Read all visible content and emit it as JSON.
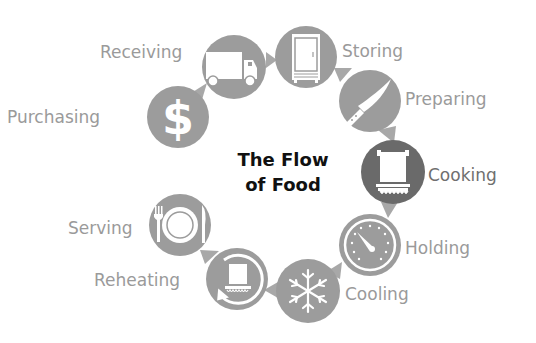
{
  "title": {
    "line1": "The Flow",
    "line2": "of Food"
  },
  "colors": {
    "circle": "#9c9c9c",
    "circle_active": "#6a6a6a",
    "arrow": "#a8a8a8",
    "label": "#9a9a9a",
    "label_active": "#6f6f6f",
    "title": "#111111"
  },
  "steps": [
    {
      "order": 1,
      "label": "Purchasing",
      "icon": "dollar-icon"
    },
    {
      "order": 2,
      "label": "Receiving",
      "icon": "truck-icon"
    },
    {
      "order": 3,
      "label": "Storing",
      "icon": "refrigerator-icon"
    },
    {
      "order": 4,
      "label": "Preparing",
      "icon": "knife-icon"
    },
    {
      "order": 5,
      "label": "Cooking",
      "icon": "cooking-pot-icon"
    },
    {
      "order": 6,
      "label": "Holding",
      "icon": "gauge-icon"
    },
    {
      "order": 7,
      "label": "Cooling",
      "icon": "snowflake-icon"
    },
    {
      "order": 8,
      "label": "Reheating",
      "icon": "reheat-pot-icon"
    },
    {
      "order": 9,
      "label": "Serving",
      "icon": "plate-utensils-icon"
    }
  ]
}
